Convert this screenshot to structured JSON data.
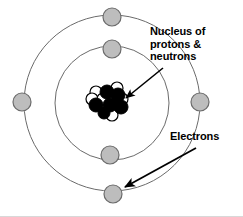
{
  "figure": {
    "width": 243,
    "height": 217,
    "background_color": "#ffffff"
  },
  "labels": {
    "nucleus": "Nucleus of\nprotons &\nneutrons",
    "electrons": "Electrons"
  },
  "colors": {
    "orbit_stroke": "#6b6b6b",
    "electron_fill": "#bdbdbd",
    "electron_stroke": "#6b6b6b",
    "proton_fill": "#000000",
    "neutron_fill": "#ffffff",
    "particle_stroke": "#000000",
    "arrow": "#000000",
    "text": "#000000",
    "border": "#d8d8d8"
  },
  "diagram_data": {
    "type": "atomic-model",
    "center": {
      "x": 112,
      "y": 103
    },
    "orbits": [
      {
        "name": "inner-shell",
        "radius": 57,
        "electron_count": 2
      },
      {
        "name": "outer-shell",
        "radius": 88,
        "electron_count": 4
      }
    ],
    "electrons": [
      {
        "shell": "outer-shell",
        "position": "top",
        "cx": 112,
        "cy": 17,
        "r": 9
      },
      {
        "shell": "outer-shell",
        "position": "left",
        "cx": 22,
        "cy": 102,
        "r": 9
      },
      {
        "shell": "outer-shell",
        "position": "right",
        "cx": 200,
        "cy": 102,
        "r": 9
      },
      {
        "shell": "outer-shell",
        "position": "bottom",
        "cx": 113,
        "cy": 194,
        "r": 9
      },
      {
        "shell": "inner-shell",
        "position": "top",
        "cx": 112,
        "cy": 49,
        "r": 9
      },
      {
        "shell": "inner-shell",
        "position": "bottom",
        "cx": 110,
        "cy": 155,
        "r": 9
      }
    ],
    "nucleus": {
      "proton_count": 6,
      "neutron_count": 6,
      "protons": [
        {
          "cx": 107,
          "cy": 92,
          "r": 7
        },
        {
          "cx": 118,
          "cy": 95,
          "r": 7
        },
        {
          "cx": 96,
          "cy": 105,
          "r": 7
        },
        {
          "cx": 110,
          "cy": 105,
          "r": 7
        },
        {
          "cx": 121,
          "cy": 107,
          "r": 7
        },
        {
          "cx": 104,
          "cy": 113,
          "r": 6
        }
      ],
      "neutrons": [
        {
          "cx": 96,
          "cy": 92,
          "r": 6
        },
        {
          "cx": 117,
          "cy": 88,
          "r": 6
        },
        {
          "cx": 92,
          "cy": 99,
          "r": 6
        },
        {
          "cx": 103,
          "cy": 99,
          "r": 6
        },
        {
          "cx": 122,
          "cy": 99,
          "r": 6
        },
        {
          "cx": 112,
          "cy": 115,
          "r": 6
        }
      ]
    },
    "arrows": [
      {
        "name": "nucleus-arrow",
        "from": {
          "x": 163,
          "y": 68
        },
        "to": {
          "x": 124,
          "y": 99
        },
        "points_at": "nucleus"
      },
      {
        "name": "electrons-arrow",
        "from": {
          "x": 195,
          "y": 148
        },
        "to": {
          "x": 123,
          "y": 188
        },
        "points_at": "outer-shell-bottom-electron"
      }
    ]
  }
}
